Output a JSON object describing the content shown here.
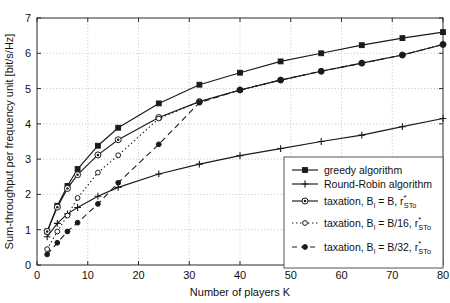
{
  "chart_data": {
    "type": "line",
    "title": "",
    "xlabel": "Number of players K",
    "ylabel": "Sum-throughput per frequency unit [bit/s/Hz]",
    "xlim": [
      0,
      80
    ],
    "ylim": [
      0,
      7
    ],
    "xticks": [
      0,
      10,
      20,
      30,
      40,
      50,
      60,
      70,
      80
    ],
    "yticks": [
      0,
      1,
      2,
      3,
      4,
      5,
      6,
      7
    ],
    "xtick_labels": [
      "0",
      "10",
      "20",
      "30",
      "40",
      "50",
      "60",
      "70",
      "80"
    ],
    "ytick_labels": [
      "0",
      "1",
      "2",
      "3",
      "4",
      "5",
      "6",
      "7"
    ],
    "grid": true,
    "legend_position": "lower right",
    "x": [
      2,
      4,
      6,
      8,
      12,
      16,
      24,
      32,
      40,
      48,
      56,
      64,
      72,
      80
    ],
    "series": [
      {
        "name": "greedy algorithm",
        "label": "greedy algorithm",
        "marker": "filled-square",
        "linestyle": "solid",
        "values": [
          0.95,
          1.68,
          2.24,
          2.72,
          3.38,
          3.89,
          4.58,
          5.11,
          5.45,
          5.77,
          6.0,
          6.23,
          6.43,
          6.6
        ]
      },
      {
        "name": "round-robin algorithm",
        "label": "Round-Robin algorithm",
        "marker": "plus",
        "linestyle": "solid",
        "values": [
          0.8,
          1.18,
          1.45,
          1.63,
          1.95,
          2.2,
          2.58,
          2.86,
          3.1,
          3.3,
          3.5,
          3.68,
          3.92,
          4.15
        ]
      },
      {
        "name": "taxation-b",
        "label": "taxation, B_l = B, r*_STo",
        "marker": "open-circle-dot",
        "linestyle": "solid",
        "values": [
          0.95,
          1.64,
          2.17,
          2.56,
          3.12,
          3.55,
          4.18,
          4.63,
          4.96,
          5.24,
          5.49,
          5.72,
          5.95,
          6.25
        ]
      },
      {
        "name": "taxation-b16",
        "label": "taxation, B_l = B/16, r*_STo",
        "marker": "open-circle",
        "linestyle": "dotted",
        "values": [
          0.45,
          0.95,
          1.4,
          1.9,
          2.62,
          3.11,
          4.15,
          4.63,
          4.96,
          5.24,
          5.49,
          5.72,
          5.95,
          6.25
        ]
      },
      {
        "name": "taxation-b32",
        "label": "taxation, B_l = B/32, r*_STo",
        "marker": "filled-circle",
        "linestyle": "dashed",
        "values": [
          0.3,
          0.63,
          0.95,
          1.2,
          1.73,
          2.33,
          3.42,
          4.6,
          4.96,
          5.24,
          5.49,
          5.72,
          5.95,
          6.25
        ]
      }
    ]
  },
  "legend": {
    "entries": [
      {
        "label": "greedy algorithm",
        "prefix": "",
        "base": "",
        "sub": "",
        "sup": ""
      },
      {
        "label": "Round-Robin algorithm",
        "prefix": "",
        "base": "",
        "sub": "",
        "sup": ""
      },
      {
        "label": "taxation, B",
        "sub1": "l",
        "mid": " = B, r",
        "sup": "*",
        "sub2": "STo"
      },
      {
        "label": "taxation, B",
        "sub1": "l",
        "mid": " = B/16, r",
        "sup": "*",
        "sub2": "STo"
      },
      {
        "label": "taxation, B",
        "sub1": "l",
        "mid": " = B/32, r",
        "sup": "*",
        "sub2": "STo"
      }
    ]
  },
  "colors": {
    "line": "#1a1a1a",
    "grid": "#b4b4b4",
    "axis": "#2b2b2b",
    "background": "#ffffff"
  }
}
